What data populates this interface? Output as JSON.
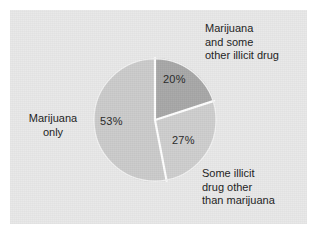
{
  "figure": {
    "background_color": "#ffffff",
    "panel_color": "#e9e9e9"
  },
  "chart_data": {
    "type": "pie",
    "title": "",
    "subtitle": "",
    "xlabel": "",
    "ylabel": "",
    "legend_position": "callout-labels",
    "grid": false,
    "start_angle_deg": 0,
    "direction": "clockwise",
    "total": 100,
    "units": "percent",
    "categories": [
      "Marijuana and some other illicit drug",
      "Some illicit drug other than marijuana",
      "Marijuana only"
    ],
    "values": [
      20,
      27,
      53
    ],
    "slices": [
      {
        "name": "marijuana-and-other-illicit",
        "label_lines": [
          "Marijuana",
          "and some",
          "other illicit drug"
        ],
        "label_text": "Marijuana and some other illicit drug",
        "value": 20,
        "value_label": "20%",
        "color": "#a8a8a8",
        "start_deg": 0,
        "end_deg": 72
      },
      {
        "name": "other-illicit-not-marijuana",
        "label_lines": [
          "Some illicit",
          "drug other",
          "than marijuana"
        ],
        "label_text": "Some illicit drug other than marijuana",
        "value": 27,
        "value_label": "27%",
        "color": "#cecece",
        "start_deg": 72,
        "end_deg": 169.2
      },
      {
        "name": "marijuana-only",
        "label_lines": [
          "Marijuana",
          "only"
        ],
        "label_text": "Marijuana only",
        "value": 53,
        "value_label": "53%",
        "color": "#cbcbcb",
        "start_deg": 169.2,
        "end_deg": 360
      }
    ],
    "separator_color": "#ffffff"
  },
  "labels": {
    "marijuana_only_line1": "Marijuana",
    "marijuana_only_line2": "only",
    "marijuana_other_line1": "Marijuana",
    "marijuana_other_line2": "and some",
    "marijuana_other_line3": "other illicit drug",
    "other_illicit_line1": "Some illicit",
    "other_illicit_line2": "drug other",
    "other_illicit_line3": "than marijuana",
    "pct_53": "53%",
    "pct_20": "20%",
    "pct_27": "27%"
  }
}
